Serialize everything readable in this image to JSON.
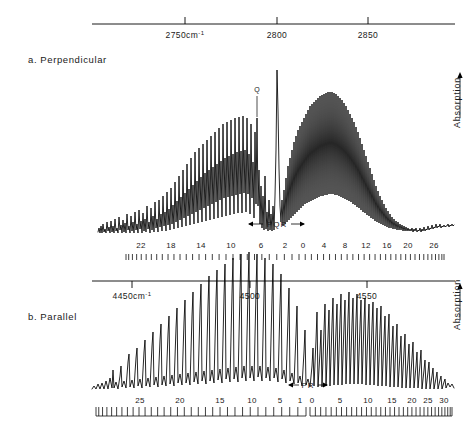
{
  "figure": {
    "kind": "infrared-absorption-spectrum",
    "panels": [
      {
        "id": "a",
        "label": "a. Perpendicular",
        "axis": {
          "ticks": [
            {
              "value": 2750,
              "label": "2750",
              "unit": "cm",
              "sup": "-1",
              "x": 185
            },
            {
              "value": 2800,
              "label": "2800",
              "unit": "",
              "sup": "",
              "x": 277
            },
            {
              "value": 2850,
              "label": "2850",
              "unit": "",
              "sup": "",
              "x": 368
            }
          ],
          "x_start": 92,
          "x_end": 455,
          "tick_side": "up"
        },
        "ylabel": "Absorption",
        "yarrow": "up",
        "branch_label": "PQR",
        "q_marker": "Q",
        "j_numbers_p": [
          "22",
          "18",
          "14",
          "10",
          "6",
          "2"
        ],
        "j_numbers_r": [
          "0",
          "4",
          "8",
          "12",
          "16",
          "20",
          "26"
        ]
      },
      {
        "id": "b",
        "label": "b. Parallel",
        "axis": {
          "ticks": [
            {
              "value": 4450,
              "label": "4450",
              "unit": "cm",
              "sup": "-1",
              "x": 132
            },
            {
              "value": 4500,
              "label": "4500",
              "unit": "",
              "sup": "",
              "x": 250
            },
            {
              "value": 4550,
              "label": "4550",
              "unit": "",
              "sup": "",
              "x": 367
            }
          ],
          "x_start": 92,
          "x_end": 455,
          "tick_side": "down"
        },
        "ylabel": "Absorption",
        "yarrow": "up",
        "branch_label": "PR",
        "j_numbers_p": [
          "25",
          "20",
          "15",
          "10",
          "5",
          "1"
        ],
        "j_numbers_r": [
          "0",
          "5",
          "10",
          "15",
          "20",
          "25",
          "30"
        ]
      }
    ]
  },
  "chart_data": {
    "type": "line",
    "title": "",
    "xlabel": "Wavenumber (cm-1)",
    "ylabel": "Absorption",
    "grid": false,
    "legend": "none",
    "panels": [
      {
        "name": "a. Perpendicular",
        "xlim": [
          2725,
          2875
        ],
        "band_origin": 2800,
        "x_axis_ticks": [
          2750,
          2800,
          2850
        ],
        "x_axis_tick_labels": [
          "2750cm-1",
          "2800",
          "2850"
        ],
        "baseline_y": 232,
        "envelope_note": "P branch rises from noise near x=100 to a broad maximum just left of band centre; strong sharp Q feature at x=277; R branch forms a broad dome peaking near x=330 then decays into noise by x=430",
        "q_peak_x": 277,
        "q_peak_height": 162,
        "q_label_peak_x": 257,
        "j_scale_p": {
          "label_values": [
            22,
            18,
            14,
            10,
            6,
            2
          ],
          "label_x": [
            141,
            171,
            201,
            231,
            261,
            285
          ],
          "tick_x_start": 126,
          "tick_x_end": 292,
          "tick_count": 28
        },
        "j_scale_r": {
          "label_values": [
            0,
            4,
            8,
            12,
            16,
            20,
            26
          ],
          "label_x": [
            303,
            324,
            345,
            366,
            387,
            408,
            434
          ],
          "tick_x_start": 299,
          "tick_x_end": 444,
          "tick_count": 30
        },
        "branch_marker": {
          "label": "PQR",
          "x_left": 248,
          "x_right": 305,
          "y": 224
        },
        "peaks_p_x": [
          110,
          116,
          122,
          128,
          134,
          140,
          146,
          152,
          158,
          164,
          170,
          176,
          182,
          188,
          194,
          200,
          206,
          212,
          218,
          224,
          230,
          236,
          242,
          248,
          254,
          260,
          266
        ],
        "peaks_p_h": [
          8,
          10,
          9,
          12,
          10,
          14,
          12,
          18,
          15,
          22,
          20,
          28,
          25,
          34,
          30,
          42,
          38,
          52,
          48,
          62,
          58,
          72,
          68,
          80,
          74,
          88,
          70
        ],
        "peaks_r_x": [
          288,
          294,
          300,
          306,
          312,
          318,
          324,
          330,
          336,
          342,
          348,
          354,
          360,
          366,
          372,
          378,
          384,
          390,
          396,
          402,
          408,
          414,
          420
        ],
        "peaks_r_h": [
          44,
          52,
          60,
          68,
          76,
          84,
          92,
          98,
          104,
          108,
          110,
          108,
          106,
          102,
          96,
          90,
          82,
          74,
          64,
          54,
          44,
          34,
          24
        ]
      },
      {
        "name": "b. Parallel",
        "xlim": [
          4430,
          4580
        ],
        "band_origin": 4500,
        "x_axis_ticks": [
          4450,
          4500,
          4550
        ],
        "x_axis_tick_labels": [
          "4450cm-1",
          "4500",
          "4550"
        ],
        "baseline_y": 389,
        "envelope_note": "Two-lobed parallel band: P branch grows from noise at x=95 to maximum near x=250, sharp gap at band centre, R branch dome peaks near x=330 and decays into noise by x=440",
        "j_scale_p": {
          "label_values": [
            25,
            20,
            15,
            10,
            5,
            1
          ],
          "label_x": [
            140,
            180,
            220,
            252,
            280,
            300
          ],
          "tick_x_start": 96,
          "tick_x_end": 306,
          "tick_count": 33
        },
        "j_scale_r": {
          "label_values": [
            0,
            5,
            10,
            15,
            20,
            25,
            30
          ],
          "label_x": [
            312,
            340,
            368,
            392,
            412,
            428,
            444
          ],
          "tick_x_start": 310,
          "tick_x_end": 452,
          "tick_count": 34
        },
        "branch_marker": {
          "label": "PR",
          "x_left": 288,
          "x_right": 328,
          "y": 385
        },
        "peaks_p_x": [
          112,
          120,
          128,
          136,
          144,
          152,
          160,
          168,
          176,
          184,
          192,
          200,
          208,
          216,
          224,
          232,
          240,
          248,
          256,
          264,
          272,
          280,
          288
        ],
        "peaks_p_h": [
          10,
          14,
          18,
          24,
          28,
          34,
          40,
          46,
          52,
          58,
          62,
          66,
          70,
          72,
          74,
          72,
          70,
          68,
          64,
          58,
          50,
          40,
          28
        ],
        "peaks_r_x": [
          316,
          322,
          328,
          334,
          340,
          346,
          352,
          358,
          364,
          370,
          376,
          382,
          388,
          394,
          400,
          406,
          412,
          418,
          424,
          430,
          436
        ],
        "peaks_r_h": [
          50,
          58,
          64,
          68,
          70,
          72,
          72,
          70,
          68,
          66,
          62,
          58,
          52,
          46,
          40,
          34,
          26,
          20,
          14,
          10,
          7
        ]
      }
    ]
  }
}
